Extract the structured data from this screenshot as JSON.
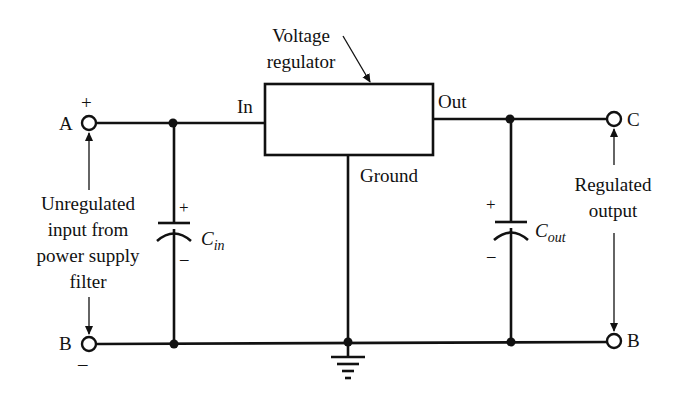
{
  "diagram": {
    "regulator": {
      "label_line1": "Voltage",
      "label_line2": "regulator",
      "pin_in": "In",
      "pin_out": "Out",
      "pin_ground": "Ground"
    },
    "terminals": {
      "a": "A",
      "b_left": "B",
      "c": "C",
      "b_right": "B",
      "plus_left": "+",
      "minus_left": "–"
    },
    "capacitors": {
      "cin": {
        "main": "C",
        "sub": "in",
        "plus": "+",
        "minus": "–"
      },
      "cout": {
        "main": "C",
        "sub": "out",
        "plus": "+",
        "minus": "–"
      }
    },
    "annotations": {
      "input": [
        "Unregulated",
        "input from",
        "power supply",
        "filter"
      ],
      "output": [
        "Regulated",
        "output"
      ]
    },
    "colors": {
      "ink": "#111111",
      "background": "#ffffff"
    }
  }
}
